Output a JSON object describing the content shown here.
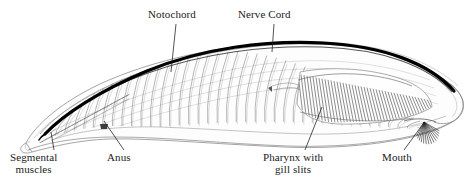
{
  "figure": {
    "style": "pen-and-ink stippled scientific illustration",
    "background_color": "#ffffff",
    "ink_color": "#111111"
  },
  "labels": {
    "notochord": {
      "text": "Notochord"
    },
    "nerve_cord": {
      "text": "Nerve Cord"
    },
    "segmental_muscles": {
      "line1": "Segmental",
      "line2": "muscles"
    },
    "anus": {
      "text": "Anus"
    },
    "pharynx": {
      "line1": "Pharynx with",
      "line2": "gill slits"
    },
    "mouth": {
      "text": "Mouth"
    }
  },
  "structures": {
    "nerve_cord_band": {
      "name": "dorsal nerve cord",
      "color": "#000000"
    },
    "notochord_rod": {
      "name": "notochord",
      "color": "#2a2a2a"
    },
    "myomeres": {
      "name": "segmental muscle chevrons",
      "count": 42
    },
    "gill_bars": {
      "name": "pharyngeal gill bars",
      "count": 45
    },
    "oral_cirri": {
      "name": "oral cirri",
      "count": 14
    }
  }
}
